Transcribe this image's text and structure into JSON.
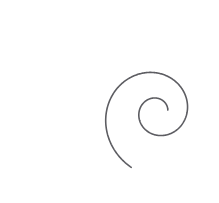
{
  "canvas": {
    "width": 219,
    "height": 203,
    "background_color": "#ffffff",
    "title": "spiral-line-drawing"
  },
  "artwork": {
    "name": "logarithmic-spiral",
    "description": "A single continuous thin gray line forming a logarithmic (nautilus) spiral that enters from the top edge, sweeps counter-clockwise around a wide outer loop, and coils inward to a small hook at the centre.",
    "stroke_color": "#5d5d62",
    "stroke_width": 1.6,
    "fill": "none",
    "line_cap": "round",
    "turns": 1.65,
    "spiral_center": {
      "x": 157,
      "y": 112
    },
    "growth_factor": 0.165,
    "start_radius": 11,
    "end_radius": 108,
    "start_angle_deg": 10,
    "end_angle_deg": 605,
    "direction": "counter-clockwise-outward",
    "bounds": {
      "left": 9,
      "top": 0,
      "right": 201,
      "bottom": 194
    },
    "extrema": [
      {
        "name": "top-edge-exit",
        "x": 153,
        "y": 0
      },
      {
        "name": "leftmost",
        "x": 10,
        "y": 101
      },
      {
        "name": "bottom",
        "x": 120,
        "y": 193
      },
      {
        "name": "rightmost",
        "x": 200,
        "y": 121
      },
      {
        "name": "inner-terminus",
        "x": 169,
        "y": 113
      }
    ],
    "path": "M 167.4 117.6 C 170.6 113.9 170.2 108.3 166.5 105.1 C 162.1 101.3 155.5 101.8 151.7 106.2 C 147.3 111.3 147.9 119.0 153.0 123.4 C 158.8 128.4 167.6 127.7 172.6 121.9 C 178.2 115.3 177.4 105.4 170.8 99.8 C 163.5 93.5 152.4 94.4 146.1 101.7 C 139.1 109.8 140.1 122.1 148.2 129.1 C 157.1 136.8 170.7 135.7 178.4 126.7 C 186.7 117.0 185.5 102.3 175.8 93.9 C 165.3 84.8 149.4 86.1 140.4 96.6 C 130.6 107.9 132.0 125.1 143.3 134.9 C 155.4 145.4 173.8 143.9 184.3 131.7 C 195.5 118.7 193.9 99.0 180.9 87.8 C 167.1 75.8 146.1 77.6 134.1 91.5 C 121.4 106.2 123.3 128.5 138.0 141.2 C 153.5 154.7 177.1 152.7 190.6 137.1 C 204.9 120.6 202.7 95.7 186.2 81.4 C 168.8 66.3 142.4 68.6 127.3 86.0 C 111.5 104.4 113.9 132.1 132.3 147.9 C 151.6 164.5 180.8 162.0 197.4 142.6 C 214.7 122.4 212.0 92.0 191.8 74.6 C 170.8 56.6 139.1 59.4 121.0 80.4 C 102.3 102.1 105.2 134.9 126.9 153.6 C 149.4 173.0 183.4 170.0 202.8 147.5 C 222.8 124.3 219.7 87.4 196.5 67.5 C 172.6 47.0 136.5 50.2 116.0 74.1 C 94.9 98.6 98.2 135.8 122.7 156.9 C 147.9 178.6 185.9 175.2 207.6 150.0"
  },
  "rendering": {
    "mode": "vector-line-art",
    "elements": 1,
    "has_text": false,
    "has_fill": false
  }
}
